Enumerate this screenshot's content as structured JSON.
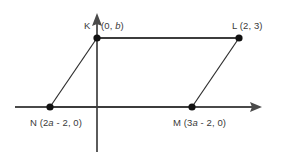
{
  "figure": {
    "colors": {
      "axis": "#4a4a4a",
      "edge_thick": "#3c3c3c",
      "edge_thin": "#2e2e2e",
      "vertex_dot": "#111111",
      "label_text": "#3a3a3a",
      "background": "#ffffff"
    },
    "axes": {
      "y_axis_label": "",
      "x_axis_label": "",
      "y_axis_arrow": "up-arrow-icon",
      "x_axis_arrow": "right-arrow-icon"
    },
    "vertices": [
      {
        "id": "K",
        "name": "K",
        "label": "K",
        "coord_label": "(0, b)",
        "coord_prefix": "(0, ",
        "coord_var": "b",
        "coord_suffix": ")",
        "px": 97,
        "py": 38
      },
      {
        "id": "L",
        "name": "L",
        "label": "L",
        "coord_label": "L (2, 3)",
        "coord_prefix": "L (2, 3)",
        "coord_var": "",
        "coord_suffix": "",
        "px": 239,
        "py": 38
      },
      {
        "id": "M",
        "name": "M",
        "label": "M",
        "coord_label": "M (3a - 2, 0)",
        "coord_prefix": "M (3",
        "coord_var": "a",
        "coord_suffix": " - 2, 0)",
        "px": 192,
        "py": 107
      },
      {
        "id": "N",
        "name": "N",
        "label": "N",
        "coord_label": "N (2a - 2, 0)",
        "coord_prefix": "N (2",
        "coord_var": "a",
        "coord_suffix": " - 2, 0)",
        "px": 50,
        "py": 107
      }
    ],
    "labels": {
      "k_vertex": "K",
      "k_coord_prefix": "(0, ",
      "k_coord_var": "b",
      "k_coord_suffix": ")",
      "l_full": "L (2, 3)",
      "n_prefix": "N (2",
      "n_var": "a",
      "n_suffix": " - 2, 0)",
      "m_prefix": "M (3",
      "m_var": "a",
      "m_suffix": " - 2, 0)"
    },
    "edges": [
      {
        "from": "K",
        "to": "L",
        "style": "thick"
      },
      {
        "from": "L",
        "to": "M",
        "style": "thin"
      },
      {
        "from": "M",
        "to": "N",
        "style": "thick"
      },
      {
        "from": "N",
        "to": "K",
        "style": "thin"
      }
    ]
  }
}
